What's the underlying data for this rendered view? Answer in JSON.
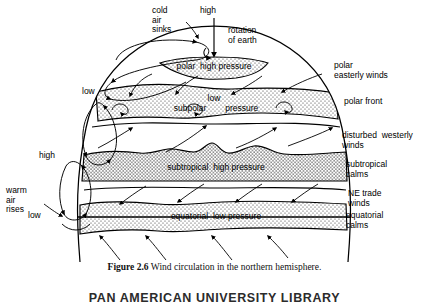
{
  "figure": {
    "caption_number": "Figure 2.6",
    "caption_text": "Wind circulation in the northern hemisphere.",
    "library_stamp": "PAN AMERICAN UNIVERSITY LIBRARY"
  },
  "axis": {
    "high_label": "high",
    "rotation_label": "rotation\nof earth"
  },
  "left_labels": {
    "cold_air_sinks": "cold\nair\nsinks",
    "low_polar": "low",
    "high_subtropical": "high",
    "warm_air_rises": "warm\nair\nrises",
    "low_equatorial": "low"
  },
  "bands": [
    {
      "name": "polar-high-pressure",
      "label": "polar  high pressure"
    },
    {
      "name": "subpolar-low-pressure",
      "label_top": "low",
      "label": "subpolar        pressure"
    },
    {
      "name": "subtropical-high-pressure",
      "label": "subtropical  high pressure"
    },
    {
      "name": "equatorial-low-pressure",
      "label": "equatorial  low pressure"
    }
  ],
  "right_labels": [
    {
      "name": "polar-easterly-winds",
      "label": "polar\neasterly winds"
    },
    {
      "name": "polar-front",
      "label": "polar front"
    },
    {
      "name": "disturbed-westerly",
      "label": "disturbed  westerly\nwinds"
    },
    {
      "name": "subtropical-calms",
      "label": "subtropical\ncalms"
    },
    {
      "name": "ne-trade-winds",
      "label": "NE trade\nwinds"
    },
    {
      "name": "equatorial-calms",
      "label": "equatorial\ncalms"
    }
  ],
  "colors": {
    "ink": "#000000",
    "paper": "#ffffff",
    "stipple": "#404040"
  }
}
